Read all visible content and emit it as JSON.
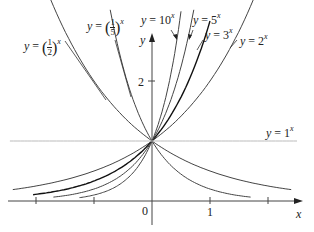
{
  "chart_data": {
    "type": "line",
    "title": "",
    "xlabel": "x",
    "ylabel": "y",
    "x_ticks": [
      -2,
      -1,
      0,
      1,
      2
    ],
    "x_tick_labels": [
      "0",
      "1"
    ],
    "y_tick_labels": [
      "2"
    ],
    "xlim": [
      -2.4,
      2.5
    ],
    "ylim": [
      0,
      3.2
    ],
    "grid": false,
    "legend": "inline labels",
    "series": [
      {
        "name": "y = 2^x",
        "base": 2,
        "x_range": [
          -2.4,
          1.75
        ],
        "label": "y = 2",
        "exp": "x"
      },
      {
        "name": "y = 3^x",
        "base": 3,
        "x_range": [
          -2.05,
          1.0
        ],
        "label": "y = 3",
        "exp": "x"
      },
      {
        "name": "y = 5^x",
        "base": 5,
        "x_range": [
          -1.7,
          0.72
        ],
        "label": "y = 5",
        "exp": "x"
      },
      {
        "name": "y = 10^x",
        "base": 10,
        "x_range": [
          -1.25,
          0.5
        ],
        "label": "y = 10",
        "exp": "x"
      },
      {
        "name": "y = (1/2)^x",
        "base": 0.5,
        "x_range": [
          -1.75,
          2.4
        ],
        "label": "y =",
        "exp": "x"
      },
      {
        "name": "y = (1/5)^x",
        "base": 0.2,
        "x_range": [
          -0.72,
          1.7
        ],
        "label": "y =",
        "exp": "x"
      },
      {
        "name": "y = 1^x",
        "base": 1,
        "x_range": [
          -2.45,
          2.5
        ],
        "label": "y = 1",
        "exp": "x"
      }
    ]
  },
  "labels": {
    "y_axis": "y",
    "x_axis": "x",
    "origin": "0",
    "tick_one": "1",
    "tick_two": "2",
    "half_num": "1",
    "half_den": "2",
    "fifth_num": "1",
    "fifth_den": "5",
    "lp": "(",
    "rp": ")"
  }
}
